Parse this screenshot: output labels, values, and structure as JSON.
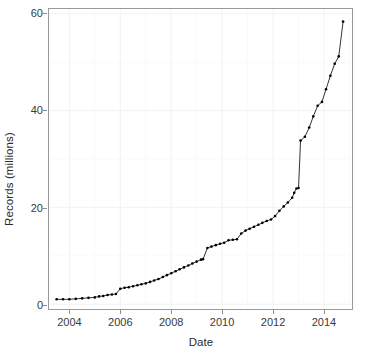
{
  "chart_data": {
    "type": "line",
    "title": "",
    "subtitle": "",
    "xlabel": "Date",
    "ylabel": "Records (millions)",
    "xlim": [
      2003.2,
      2015.1
    ],
    "ylim": [
      -1.0,
      61.0
    ],
    "grid": "faint-white-minor-and-major",
    "legend": "none",
    "marker": "filled-circle",
    "marker_color": "#000000",
    "line_color": "#000000",
    "panel_background": "#ffffff",
    "panel_border_color": "#9a9a9a",
    "gridline_color": "#f2f2f2",
    "xticks": [
      2004,
      2006,
      2008,
      2010,
      2012,
      2014
    ],
    "xtick_labels": [
      "2004",
      "2006",
      "2008",
      "2010",
      "2012",
      "2014"
    ],
    "yticks": [
      0,
      20,
      40,
      60
    ],
    "ytick_labels": [
      "0",
      "20",
      "40",
      "60"
    ],
    "series": [
      {
        "name": "Records",
        "x": [
          2003.5,
          2003.75,
          2004.0,
          2004.25,
          2004.5,
          2004.75,
          2005.0,
          2005.17,
          2005.33,
          2005.5,
          2005.67,
          2005.83,
          2006.0,
          2006.17,
          2006.33,
          2006.5,
          2006.67,
          2006.83,
          2007.0,
          2007.17,
          2007.33,
          2007.5,
          2007.67,
          2007.83,
          2008.0,
          2008.17,
          2008.33,
          2008.5,
          2008.67,
          2008.83,
          2009.0,
          2009.17,
          2009.25,
          2009.42,
          2009.58,
          2009.75,
          2009.92,
          2010.08,
          2010.25,
          2010.42,
          2010.58,
          2010.75,
          2010.92,
          2011.08,
          2011.25,
          2011.42,
          2011.58,
          2011.75,
          2011.92,
          2012.08,
          2012.25,
          2012.42,
          2012.58,
          2012.75,
          2012.83,
          2012.92,
          2013.0,
          2013.08,
          2013.25,
          2013.42,
          2013.58,
          2013.75,
          2013.92,
          2014.08,
          2014.25,
          2014.42,
          2014.58,
          2014.75
        ],
        "y": [
          1.0,
          1.0,
          1.0,
          1.1,
          1.2,
          1.3,
          1.4,
          1.6,
          1.7,
          1.9,
          2.0,
          2.1,
          3.2,
          3.4,
          3.5,
          3.7,
          3.9,
          4.1,
          4.3,
          4.6,
          4.9,
          5.2,
          5.6,
          6.0,
          6.4,
          6.8,
          7.2,
          7.6,
          8.0,
          8.4,
          8.8,
          9.2,
          9.3,
          11.6,
          11.9,
          12.2,
          12.5,
          12.7,
          13.2,
          13.3,
          13.4,
          14.6,
          15.2,
          15.6,
          16.0,
          16.4,
          16.8,
          17.2,
          17.5,
          18.2,
          19.3,
          20.2,
          21.0,
          22.0,
          23.0,
          23.9,
          24.0,
          33.8,
          34.6,
          36.5,
          38.8,
          41.0,
          41.8,
          44.4,
          47.2,
          49.7,
          51.2,
          58.4
        ]
      }
    ],
    "annotations": [
      "steep vertical jump from ~24 to ~34 near the start of 2013",
      "small step-up near 2009.4 from ~9.3 to ~11.6",
      "final point ~58.4 in late 2014"
    ]
  }
}
